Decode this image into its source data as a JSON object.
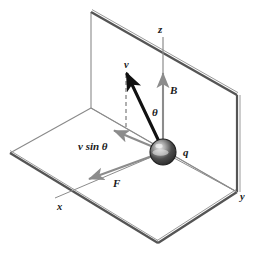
{
  "diagram": {
    "type": "physics-vector-diagram",
    "colors": {
      "plane_edge_dark": "#4a4a4a",
      "plane_edge_light": "#8a8a8a",
      "axis_gray": "#8c8c8c",
      "vector_black": "#111111",
      "vector_gray": "#8c8c8c",
      "label_color": "#1a1a1a",
      "sphere_dark": "#2b2b2b",
      "sphere_mid": "#6e6e6e",
      "sphere_light": "#d8d8d8",
      "background": "#ffffff"
    },
    "labels": {
      "z_axis": "z",
      "x_axis": "x",
      "y_axis": "y",
      "field": "B",
      "angle": "θ",
      "velocity": "v",
      "velocity_component": "v sin θ",
      "force": "F",
      "charge": "q"
    },
    "vectors": [
      {
        "name": "velocity",
        "label": "v",
        "style": "solid-thick-black",
        "from": [
          163,
          152
        ],
        "to": [
          126,
          72
        ]
      },
      {
        "name": "magnetic-field",
        "label": "B",
        "style": "solid-gray",
        "from": [
          163,
          152
        ],
        "to": [
          163,
          72
        ]
      },
      {
        "name": "velocity-perp",
        "label": "v sin θ",
        "style": "solid-gray",
        "from": [
          163,
          152
        ],
        "to": [
          113,
          131
        ]
      },
      {
        "name": "magnetic-force",
        "label": "F",
        "style": "solid-gray",
        "from": [
          163,
          152
        ],
        "to": [
          87,
          180
        ]
      },
      {
        "name": "projection-dashed",
        "label": "",
        "style": "dashed-gray",
        "from": [
          126,
          72
        ],
        "to": [
          126,
          131
        ]
      }
    ],
    "planes": [
      {
        "name": "vertical-plane-yz",
        "points": "91,12 237,95 237,192 91,108"
      },
      {
        "name": "horizontal-plane-xy",
        "points": "10,153 91,108 237,192 158,243"
      }
    ],
    "axes": [
      {
        "name": "z-axis",
        "from": [
          163,
          37
        ],
        "to": [
          163,
          152
        ]
      },
      {
        "name": "x-axis",
        "from": [
          163,
          152
        ],
        "to": [
          55,
          198
        ]
      },
      {
        "name": "y-axis",
        "from": [
          163,
          152
        ],
        "to": [
          237,
          192
        ]
      }
    ],
    "charge": {
      "name": "charged-sphere",
      "center": [
        163,
        152
      ],
      "radius": 13,
      "label": "q"
    }
  }
}
